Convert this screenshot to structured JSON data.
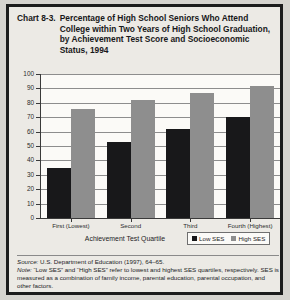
{
  "chart_number": "Chart 8-3.",
  "title": "Percentage of High School Seniors Who Attend College within Two Years of High School Graduation, by Achievement Test Score and Socioeconomic Status, 1994",
  "axis": {
    "xlabel": "Achievement Test Quartile",
    "ylabel": "",
    "yticks": [
      "100",
      "90",
      "80",
      "70",
      "60",
      "50",
      "40",
      "30",
      "20",
      "10",
      "0"
    ]
  },
  "legend": {
    "items": [
      {
        "label": "Low SES",
        "color": "#18181a"
      },
      {
        "label": "High SES",
        "color": "#8e8e8e"
      }
    ]
  },
  "notes": {
    "source_label": "Source:",
    "source_text": " U.S. Department of Education (1997), 64–65.",
    "note_label": "Note:",
    "note_text": " “Low SES” and “High SES” refer to lowest and highest SES quartiles, respectively. SES is measured as a combination of family income, parental education, parental occupation, and other factors."
  },
  "chart_data": {
    "type": "bar",
    "title": "Percentage of High School Seniors Who Attend College within Two Years of High School Graduation, by Achievement Test Score and Socioeconomic Status, 1994",
    "xlabel": "Achievement Test Quartile",
    "ylabel": "",
    "ylim": [
      0,
      100
    ],
    "ytick_interval": 10,
    "grid": true,
    "legend_position": "bottom-right",
    "categories": [
      "First (Lowest)",
      "Second",
      "Third",
      "Fourth (Highest)"
    ],
    "series": [
      {
        "name": "Low SES",
        "color": "#18181a",
        "values": [
          35,
          53,
          62,
          70
        ]
      },
      {
        "name": "High SES",
        "color": "#8e8e8e",
        "values": [
          76,
          82,
          87,
          92
        ]
      }
    ]
  }
}
